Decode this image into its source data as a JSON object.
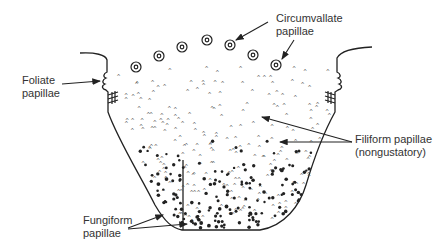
{
  "diagram": {
    "title": "",
    "labels": {
      "circumvallate": {
        "line1": "Circumvallate",
        "line2": "papillae"
      },
      "foliate": {
        "line1": "Foliate",
        "line2": "papillae"
      },
      "filiform": {
        "line1": "Filiform papillae",
        "line2": "(nongustatory)"
      },
      "fungiform": {
        "line1": "Fungiform",
        "line2": "papillae"
      }
    },
    "circumvallate_positions": [
      [
        136,
        67
      ],
      [
        159,
        56
      ],
      [
        182,
        47
      ],
      [
        207,
        40
      ],
      [
        230,
        45
      ],
      [
        253,
        55
      ],
      [
        276,
        65
      ]
    ],
    "colors": {
      "ink": "#222222",
      "text": "#333333",
      "background": "#ffffff"
    }
  }
}
